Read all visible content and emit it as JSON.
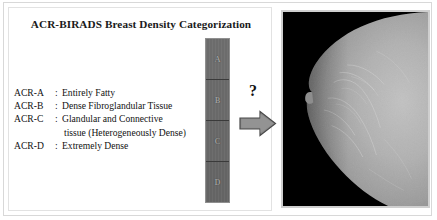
{
  "figure": {
    "title": "ACR-BIRADS Breast Density Categorization"
  },
  "legend": {
    "rows": [
      {
        "code": "ACR-A",
        "sep": ":",
        "text": "Entirely Fatty"
      },
      {
        "code": "ACR-B",
        "sep": ":",
        "text": "Dense Fibroglandular Tissue"
      },
      {
        "code": "ACR-C",
        "sep": ":",
        "text": "Glandular and Connective"
      },
      {
        "code": "",
        "sep": "",
        "text": "tissue (Heterogeneously Dense)"
      },
      {
        "code": "ACR-D",
        "sep": ":",
        "text": "Extremely Dense"
      }
    ]
  },
  "density_column": {
    "cells": [
      {
        "label": "A",
        "color": "#6e6e6e"
      },
      {
        "label": "B",
        "color": "#6b6b6b"
      },
      {
        "label": "C",
        "color": "#696969"
      },
      {
        "label": "D",
        "color": "#666666"
      }
    ]
  },
  "transition": {
    "question_mark": "?",
    "arrow_icon": "right-arrow-icon",
    "arrow_color": "#8a8a8a"
  },
  "mammogram": {
    "caption": "",
    "background_color": "#000000",
    "tissue_color": "#a9a9a9",
    "border_color": "#cfcfcf"
  },
  "colors": {
    "frame": "#d8d8d8",
    "text": "#121212",
    "cell_label": "#9d9d9d"
  }
}
